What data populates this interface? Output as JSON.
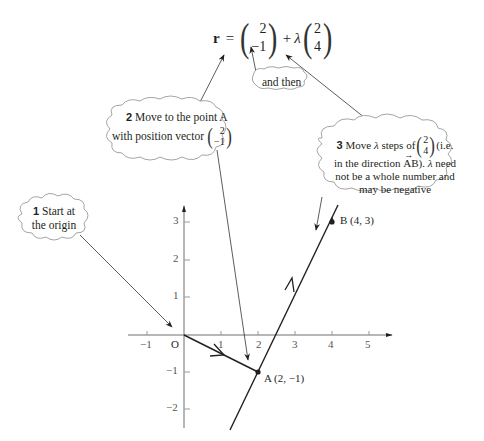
{
  "equation": {
    "lhs": "r",
    "equals": "=",
    "vector_a": [
      "2",
      "−1"
    ],
    "plus": "+",
    "lambda": "λ",
    "vector_d": [
      "2",
      "4"
    ]
  },
  "callouts": {
    "step1": {
      "num": "1",
      "line1": "Start at",
      "line2": "the origin"
    },
    "step2": {
      "num": "2",
      "line1": "Move to the point A",
      "line2": "with position vector",
      "vector": [
        "2",
        "−1"
      ]
    },
    "and_then": {
      "label": "and then"
    },
    "step3": {
      "num": "3",
      "line1a": "Move",
      "lambda": "λ",
      "line1b": "steps of",
      "vector": [
        "2",
        "4"
      ],
      "line1c": "(i.e.",
      "line2a": "in the direction",
      "ab": "AB",
      "line2b": ").",
      "line2c": "need",
      "line3": "not be a whole number and",
      "line4": "may be negative"
    }
  },
  "axes": {
    "origin_label": "O",
    "x_ticks": [
      "−1",
      "1",
      "2",
      "3",
      "4",
      "5"
    ],
    "y_ticks": [
      "3",
      "2",
      "1",
      "−1",
      "−2"
    ]
  },
  "points": {
    "A": {
      "label": "A (2, −1)",
      "x": 2,
      "y": -1
    },
    "B": {
      "label": "B (4, 3)",
      "x": 4,
      "y": 3
    }
  },
  "colors": {
    "ink": "#231f20",
    "axis": "#6d6e71",
    "cloud_stroke": "#9a9a9a"
  }
}
